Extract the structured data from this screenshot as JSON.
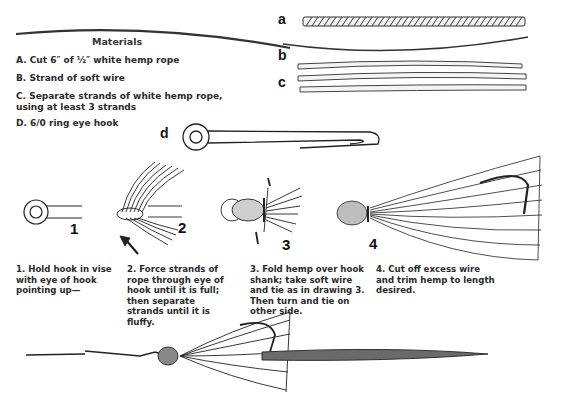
{
  "materials": {
    "title": "Materials",
    "items": [
      {
        "letter": "A.",
        "text": "Cut 6″ of ½″ white hemp rope"
      },
      {
        "letter": "B.",
        "text": "Strand of soft wire"
      },
      {
        "letter": "C.",
        "text": "Separate strands of white hemp rope, using at least 3 strands"
      },
      {
        "letter": "D.",
        "text": "6/0 ring eye hook"
      }
    ]
  },
  "figure_labels": {
    "a": "a",
    "b": "b",
    "c": "c",
    "d": "d"
  },
  "steps": [
    {
      "number": "1",
      "text": "1. Hold hook in vise with eye of hook pointing up—"
    },
    {
      "number": "2",
      "text": "2. Force strands of rope through eye of hook until it is full; then separate strands until it is fluffy."
    },
    {
      "number": "3",
      "text": "3. Fold hemp over hook shank; take soft wire and tie as in drawing 3. Then turn and tie on other side."
    },
    {
      "number": "4",
      "text": "4. Cut off excess wire and trim hemp to length desired."
    }
  ],
  "colors": {
    "ink": "#1e1e1e",
    "paper": "#ffffff"
  }
}
